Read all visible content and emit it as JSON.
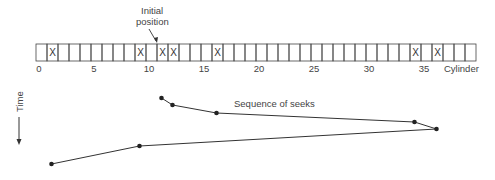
{
  "diagram": {
    "initial_position_label": [
      "Initial",
      "position"
    ],
    "initial_position_cylinder": 11,
    "axis_label": "Cylinder",
    "time_label": "Time",
    "sequence_label": "Sequence of seeks",
    "cylinder_count": 40,
    "tick_labels": [
      0,
      5,
      10,
      15,
      20,
      25,
      30,
      35
    ],
    "requested_cylinders": [
      1,
      9,
      11,
      12,
      16,
      34,
      36
    ],
    "request_mark": "X",
    "seek_sequence": [
      11,
      12,
      16,
      34,
      36,
      9,
      1
    ]
  }
}
